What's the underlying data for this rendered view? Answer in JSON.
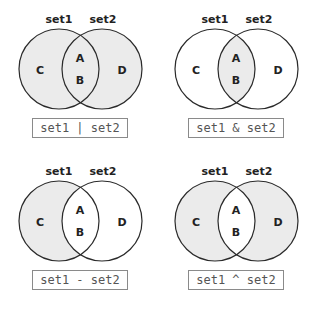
{
  "colors": {
    "fill": "#ebebeb",
    "stroke": "#2a2a2a",
    "box_border": "#8a8a8a",
    "box_text": "#555555"
  },
  "set_labels": {
    "left": "set1",
    "right": "set2"
  },
  "regions": {
    "left_only": "C",
    "top_overlap": "A",
    "bottom_overlap": "B",
    "right_only": "D"
  },
  "panels": [
    {
      "operation": "set1 | set2",
      "meaning": "union",
      "shaded": [
        "C",
        "A",
        "B",
        "D"
      ]
    },
    {
      "operation": "set1 & set2",
      "meaning": "intersection",
      "shaded": [
        "A",
        "B"
      ]
    },
    {
      "operation": "set1 - set2",
      "meaning": "difference",
      "shaded": [
        "C"
      ]
    },
    {
      "operation": "set1 ^ set2",
      "meaning": "symmetric difference",
      "shaded": [
        "C",
        "D"
      ]
    }
  ]
}
